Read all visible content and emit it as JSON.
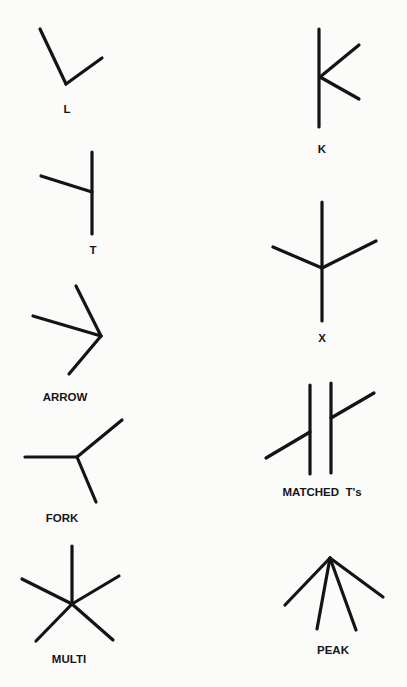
{
  "diagram": {
    "kind": "line-junction types",
    "junctions": [
      {
        "id": "L",
        "label": "L",
        "label_pos": [
          67,
          113
        ],
        "segments": [
          [
            40,
            29,
            66,
            84
          ],
          [
            66,
            84,
            102,
            58
          ]
        ]
      },
      {
        "id": "K",
        "label": "K",
        "label_pos": [
          322,
          153
        ],
        "segments": [
          [
            319,
            29,
            319,
            127
          ],
          [
            320,
            77,
            359,
            45
          ],
          [
            320,
            77,
            359,
            99
          ]
        ]
      },
      {
        "id": "T",
        "label": "T",
        "label_pos": [
          93,
          254
        ],
        "segments": [
          [
            92,
            152,
            92,
            234
          ],
          [
            41,
            176,
            92,
            192
          ]
        ]
      },
      {
        "id": "X",
        "label": "X",
        "label_pos": [
          322,
          342
        ],
        "segments": [
          [
            322,
            202,
            322,
            321
          ],
          [
            322,
            268,
            273,
            247
          ],
          [
            322,
            268,
            376,
            241
          ]
        ]
      },
      {
        "id": "ARROW",
        "label": "ARROW",
        "label_pos": [
          65,
          401
        ],
        "segments": [
          [
            101,
            336,
            76,
            286
          ],
          [
            101,
            336,
            33,
            316
          ],
          [
            101,
            336,
            69,
            374
          ]
        ]
      },
      {
        "id": "MATCHED_TS",
        "label": "MATCHED  T's",
        "label_pos": [
          322,
          496
        ],
        "segments": [
          [
            310,
            385,
            310,
            474
          ],
          [
            331,
            383,
            331,
            473
          ],
          [
            266,
            458,
            310,
            432
          ],
          [
            331,
            418,
            374,
            393
          ]
        ]
      },
      {
        "id": "FORK",
        "label": "FORK",
        "label_pos": [
          62,
          522
        ],
        "segments": [
          [
            77,
            457,
            25,
            457
          ],
          [
            77,
            457,
            122,
            420
          ],
          [
            77,
            457,
            96,
            502
          ]
        ]
      },
      {
        "id": "MULTI",
        "label": "MULTI",
        "label_pos": [
          69,
          663
        ],
        "segments": [
          [
            72,
            604,
            72,
            546
          ],
          [
            72,
            604,
            22,
            579
          ],
          [
            72,
            604,
            119,
            576
          ],
          [
            72,
            604,
            36,
            641
          ],
          [
            72,
            604,
            113,
            640
          ]
        ]
      },
      {
        "id": "PEAK",
        "label": "PEAK",
        "label_pos": [
          333,
          654
        ],
        "segments": [
          [
            330,
            558,
            285,
            605
          ],
          [
            330,
            558,
            317,
            629
          ],
          [
            330,
            558,
            356,
            630
          ],
          [
            330,
            558,
            383,
            597
          ]
        ]
      }
    ]
  },
  "colors": {
    "ink": "#141414",
    "paper": "#fbfbfa"
  }
}
